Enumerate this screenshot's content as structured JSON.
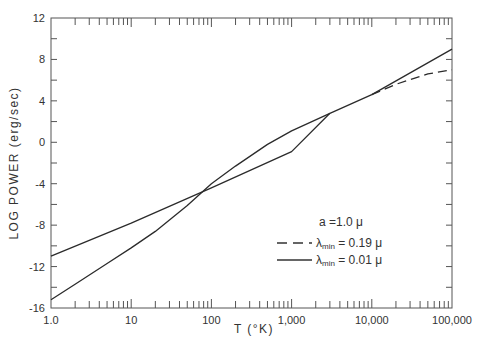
{
  "chart_data": {
    "type": "line",
    "title": "",
    "xlabel": "T (°K)",
    "ylabel": "LOG  POWER  (erg/sec)",
    "xscale": "log",
    "xlim": [
      1,
      100000
    ],
    "ylim": [
      -16,
      12
    ],
    "grid": false,
    "x_tick_labels": [
      "1.0",
      "10",
      "100",
      "1,000",
      "10,000",
      "100,000"
    ],
    "x_tick_values": [
      1,
      10,
      100,
      1000,
      10000,
      100000
    ],
    "y_tick_labels": [
      "12",
      "8",
      "4",
      "0",
      "-4",
      "-8",
      "-12",
      "-16"
    ],
    "y_tick_values": [
      12,
      8,
      4,
      0,
      -4,
      -8,
      -12,
      -16
    ],
    "legend_position": "lower right (inside plot)",
    "legend": {
      "header": "a =1.0 μ",
      "entries": [
        {
          "label_prefix": "λ",
          "label_sub": "min",
          "label_suffix": " = 0.19 μ",
          "style": "dashed"
        },
        {
          "label_prefix": "λ",
          "label_sub": "min",
          "label_suffix": " = 0.01 μ",
          "style": "solid"
        }
      ]
    },
    "series": [
      {
        "name": "λmin = 0.01 μ (upper-left branch)",
        "style": "solid",
        "x": [
          1,
          10,
          100,
          1000,
          3000,
          10000,
          100000
        ],
        "y": [
          -11,
          -7.8,
          -4.4,
          -0.9,
          2.8,
          4.6,
          9.0
        ]
      },
      {
        "name": "steeper branch (merges at ~3,000 K)",
        "style": "solid",
        "x": [
          1,
          2,
          5,
          10,
          20,
          50,
          100,
          200,
          500,
          1000,
          3000
        ],
        "y": [
          -15.2,
          -13.7,
          -11.7,
          -10.2,
          -8.6,
          -6.1,
          -4.0,
          -2.3,
          -0.2,
          1.1,
          2.8
        ]
      },
      {
        "name": "λmin = 0.19 μ",
        "style": "dashed",
        "x": [
          10000,
          20000,
          50000,
          100000
        ],
        "y": [
          4.6,
          5.6,
          6.6,
          7.0
        ]
      }
    ]
  }
}
